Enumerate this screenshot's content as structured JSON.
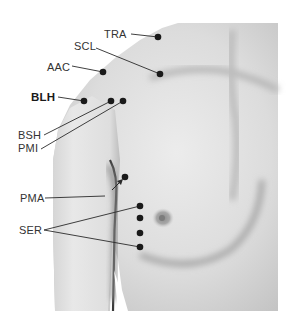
{
  "figure": {
    "colors": {
      "background": "#ffffff",
      "skin_light": "#eaeaea",
      "skin_mid": "#cfcfcf",
      "skin_shadow": "#9a9a9a",
      "marker": "#1a1a1a",
      "leader_line": "#2a2a2a",
      "label_text": "#333333"
    },
    "labels": [
      {
        "id": "TRA",
        "text": "TRA",
        "bold": false,
        "x": 104,
        "y": 30
      },
      {
        "id": "SCL",
        "text": "SCL",
        "bold": false,
        "x": 74,
        "y": 42
      },
      {
        "id": "AAC",
        "text": "AAC",
        "bold": false,
        "x": 47,
        "y": 63
      },
      {
        "id": "BLH",
        "text": "BLH",
        "bold": true,
        "x": 31,
        "y": 92
      },
      {
        "id": "BSH",
        "text": "BSH",
        "bold": false,
        "x": 18,
        "y": 130
      },
      {
        "id": "PMI",
        "text": "PMI",
        "bold": false,
        "x": 18,
        "y": 143
      },
      {
        "id": "PMA",
        "text": "PMA",
        "bold": false,
        "x": 20,
        "y": 193
      },
      {
        "id": "SER",
        "text": "SER",
        "bold": false,
        "x": 19,
        "y": 225
      }
    ]
  }
}
